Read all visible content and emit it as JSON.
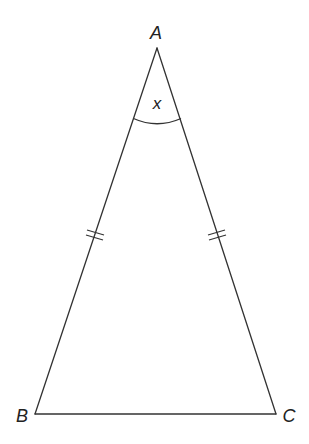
{
  "diagram": {
    "type": "isosceles-triangle",
    "colors": {
      "line": "#333333",
      "text": "#222222",
      "background": "#ffffff"
    },
    "vertices": {
      "A": {
        "label": "A",
        "x": 157,
        "y": 48
      },
      "B": {
        "label": "B",
        "x": 35,
        "y": 414
      },
      "C": {
        "label": "C",
        "x": 276,
        "y": 414
      }
    },
    "angle_label": {
      "vertex": "A",
      "text": "x"
    },
    "equal_sides": [
      "AB",
      "AC"
    ],
    "tick_marks": {
      "count_per_side": 2
    }
  }
}
